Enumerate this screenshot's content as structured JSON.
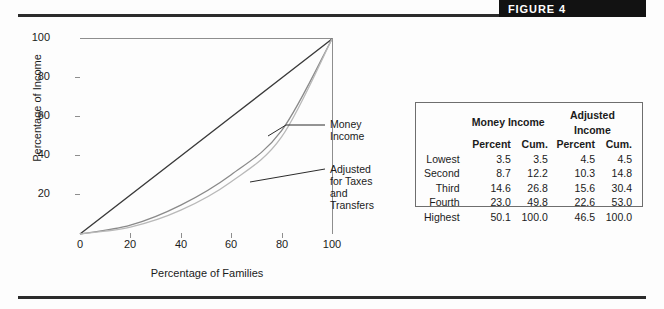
{
  "figure": {
    "banner_label": "FIGURE 4"
  },
  "chart_data": {
    "type": "line",
    "title": "",
    "xlabel": "Percentage of Families",
    "ylabel": "Percentage of Income",
    "xlim": [
      0,
      100
    ],
    "ylim": [
      0,
      100
    ],
    "xticks": [
      0,
      20,
      40,
      60,
      80,
      100
    ],
    "yticks": [
      0,
      20,
      40,
      60,
      80,
      100
    ],
    "grid": false,
    "legend_position": "inline-annotations",
    "annotations": [
      {
        "text": "Money Income",
        "target_series": "Money Income"
      },
      {
        "text": "Adjusted for Taxes and Transfers",
        "target_series": "Adjusted Income"
      }
    ],
    "series": [
      {
        "name": "Line of Equality",
        "color": "#3a3a3a",
        "x": [
          0,
          20,
          40,
          60,
          80,
          100
        ],
        "y": [
          0,
          20,
          40,
          60,
          80,
          100
        ]
      },
      {
        "name": "Adjusted Income",
        "color": "#8a8a8a",
        "x": [
          0,
          20,
          40,
          60,
          80,
          100
        ],
        "y": [
          0,
          4.5,
          14.8,
          30.4,
          53.0,
          100.0
        ]
      },
      {
        "name": "Money Income",
        "color": "#b9b9b9",
        "x": [
          0,
          20,
          40,
          60,
          80,
          100
        ],
        "y": [
          0,
          3.5,
          12.2,
          26.8,
          49.8,
          100.0
        ]
      }
    ]
  },
  "annotations": {
    "money_income": "Money Income",
    "adjusted_line1": "Adjusted for Taxes",
    "adjusted_line2": "and Transfers"
  },
  "table": {
    "group_headers": [
      "Money Income",
      "Adjusted Income"
    ],
    "sub_headers": [
      "Percent",
      "Cum.",
      "Percent",
      "Cum."
    ],
    "rows": [
      {
        "label": "Lowest",
        "money_percent": "3.5",
        "money_cum": "3.5",
        "adj_percent": "4.5",
        "adj_cum": "4.5"
      },
      {
        "label": "Second",
        "money_percent": "8.7",
        "money_cum": "12.2",
        "adj_percent": "10.3",
        "adj_cum": "14.8"
      },
      {
        "label": "Third",
        "money_percent": "14.6",
        "money_cum": "26.8",
        "adj_percent": "15.6",
        "adj_cum": "30.4"
      },
      {
        "label": "Fourth",
        "money_percent": "23.0",
        "money_cum": "49.8",
        "adj_percent": "22.6",
        "adj_cum": "53.0"
      },
      {
        "label": "Highest",
        "money_percent": "50.1",
        "money_cum": "100.0",
        "adj_percent": "46.5",
        "adj_cum": "100.0"
      }
    ]
  },
  "axes": {
    "y_ticks": [
      "100",
      "80",
      "60",
      "40",
      "20"
    ],
    "x_ticks": [
      "0",
      "20",
      "40",
      "60",
      "80",
      "100"
    ]
  }
}
